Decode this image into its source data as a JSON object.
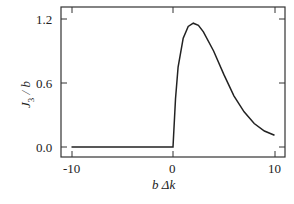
{
  "chart_data": {
    "type": "line",
    "title": "",
    "xlabel": "b Δk",
    "ylabel": "J₃ / b",
    "xlim": [
      -11,
      11
    ],
    "ylim": [
      -0.1,
      1.35
    ],
    "xticks": [
      "-10",
      "0",
      "10"
    ],
    "yticks": [
      "0.0",
      "0.6",
      "1.2"
    ],
    "grid": false,
    "legend": null,
    "series": [
      {
        "name": "J3/b",
        "x": [
          -10,
          -5,
          0,
          0.25,
          0.5,
          1,
          1.5,
          2,
          2.5,
          3,
          4,
          5,
          6,
          7,
          8,
          9,
          10
        ],
        "y": [
          0,
          0,
          0,
          0.45,
          0.75,
          1.02,
          1.13,
          1.16,
          1.14,
          1.08,
          0.9,
          0.68,
          0.48,
          0.33,
          0.22,
          0.15,
          0.11
        ]
      }
    ]
  },
  "labels": {
    "x_axis": "b Δk",
    "y_axis_main": "J",
    "y_axis_sub": "3",
    "y_axis_rest": " / b",
    "xtick_0": "-10",
    "xtick_1": "0",
    "xtick_2": "10",
    "ytick_0": "0.0",
    "ytick_1": "0.6",
    "ytick_2": "1.2"
  }
}
